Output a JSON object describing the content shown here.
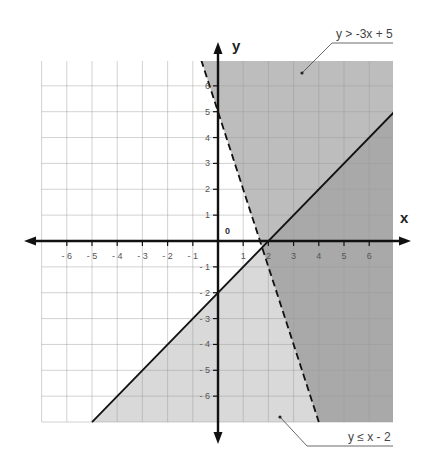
{
  "chart_data": {
    "type": "line",
    "title": "",
    "xlabel": "x",
    "ylabel": "y",
    "xlim": [
      -7,
      7
    ],
    "ylim": [
      -7,
      7
    ],
    "grid": true,
    "origin_label": "0",
    "x_ticks": [
      -6,
      -5,
      -4,
      -3,
      -2,
      -1,
      1,
      2,
      3,
      4,
      5,
      6
    ],
    "y_ticks": [
      -6,
      -5,
      -4,
      -3,
      -2,
      -1,
      1,
      2,
      3,
      4,
      5,
      6
    ],
    "x_tick_labels": [
      "- 6",
      "- 5",
      "- 4",
      "- 3",
      "- 2",
      "- 1",
      "1",
      "2",
      "3",
      "4",
      "5",
      "6"
    ],
    "y_tick_labels": [
      "- 6",
      "- 5",
      "- 4",
      "- 3",
      "- 2",
      "- 1",
      "1",
      "2",
      "3",
      "4",
      "5",
      "6"
    ],
    "series": [
      {
        "name": "y > -3x + 5",
        "equation": "y = -3x + 5",
        "slope": -3,
        "intercept": 5,
        "line_style": "dashed",
        "inequality": ">",
        "shaded_side": "above",
        "points": [
          [
            -0.667,
            7
          ],
          [
            4,
            -7
          ]
        ],
        "fill_color": "#bdbdbd"
      },
      {
        "name": "y ≤ x - 2",
        "equation": "y = x - 2",
        "slope": 1,
        "intercept": -2,
        "line_style": "solid",
        "inequality": "≤",
        "shaded_side": "below",
        "points": [
          [
            -5,
            -7
          ],
          [
            7,
            5
          ]
        ],
        "fill_color": "#d9d9d9"
      }
    ],
    "overlap_fill_color": "#a9a9a9",
    "intersection_point": [
      1.75,
      -0.25
    ],
    "annotations": [
      {
        "text": "y > -3x + 5",
        "position": "top-right"
      },
      {
        "text": "y ≤ x - 2",
        "position": "bottom-right"
      }
    ]
  },
  "labels": {
    "x_axis": "x",
    "y_axis": "y",
    "origin": "0",
    "annotation_top": "y > -3x + 5",
    "annotation_bottom": "y ≤ x - 2"
  }
}
